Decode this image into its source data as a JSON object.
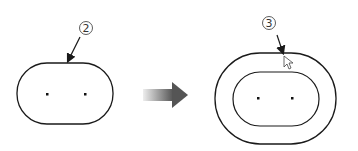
{
  "left": {
    "label": "2",
    "description": "slot sketch before offset"
  },
  "right": {
    "label": "3",
    "description": "slot sketch with offset entity"
  },
  "transition": {
    "icon": "arrow-right-icon"
  },
  "colors": {
    "line": "#1a1a1a",
    "arrow_dark": "#555555",
    "arrow_light": "#dddddd"
  }
}
